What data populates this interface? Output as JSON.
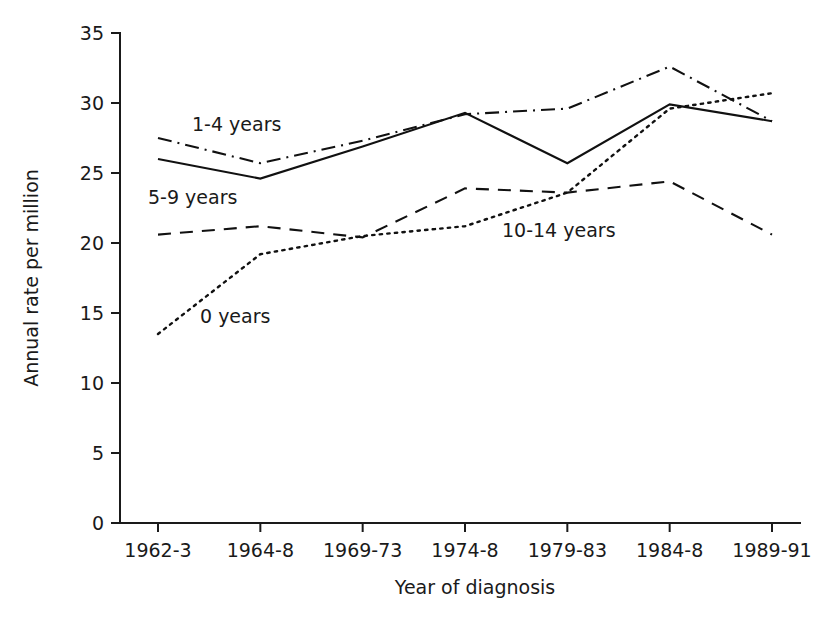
{
  "chart_data": {
    "type": "line",
    "title": "",
    "xlabel": "Year of diagnosis",
    "ylabel": "Annual rate per million",
    "categories": [
      "1962-3",
      "1964-8",
      "1969-73",
      "1974-8",
      "1979-83",
      "1984-8",
      "1989-91"
    ],
    "ylim": [
      0,
      35
    ],
    "yticks": [
      0,
      5,
      10,
      15,
      20,
      25,
      30,
      35
    ],
    "grid": false,
    "legend_position": "inline-annotations",
    "series": [
      {
        "name": "0 years",
        "linestyle": "dotted",
        "color": "#111111",
        "values": [
          13.5,
          19.2,
          20.5,
          21.2,
          23.6,
          29.6,
          30.7
        ]
      },
      {
        "name": "1-4 years",
        "linestyle": "dash-dot",
        "color": "#111111",
        "values": [
          27.5,
          25.7,
          27.3,
          29.2,
          29.6,
          32.6,
          28.7
        ]
      },
      {
        "name": "5-9 years",
        "linestyle": "solid",
        "color": "#111111",
        "values": [
          26.0,
          24.6,
          26.9,
          29.3,
          25.7,
          29.9,
          28.7
        ]
      },
      {
        "name": "10-14 years",
        "linestyle": "dashed",
        "color": "#111111",
        "values": [
          20.6,
          21.2,
          20.4,
          23.9,
          23.6,
          24.4,
          20.6
        ]
      }
    ],
    "annotations": [
      {
        "text": "1-4 years",
        "x_px": 192,
        "y_px": 131
      },
      {
        "text": "5-9 years",
        "x_px": 148,
        "y_px": 204
      },
      {
        "text": "0 years",
        "x_px": 200,
        "y_px": 323
      },
      {
        "text": "10-14 years",
        "x_px": 502,
        "y_px": 237
      }
    ]
  },
  "figure": {
    "background_color": "#ffffff",
    "ink_color": "#111111"
  }
}
